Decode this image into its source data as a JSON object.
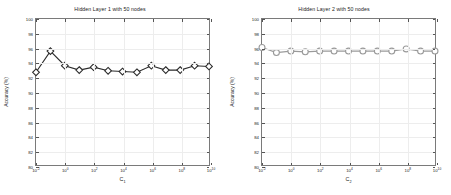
{
  "figure": {
    "background": "#ffffff",
    "width": 451,
    "height": 195
  },
  "panels": [
    {
      "id": "left",
      "title": "Hidden Layer 1 with 50 nodes",
      "xlabel_base": "C",
      "xlabel_sub": "1",
      "ylabel": "Accuracy (%)"
    },
    {
      "id": "right",
      "title": "Hidden Layer 2 with 50 nodes",
      "xlabel_base": "C",
      "xlabel_sub": "2",
      "ylabel": "Accuracy (%)"
    }
  ],
  "axis": {
    "ylim": [
      80,
      100
    ],
    "yticks": [
      80,
      82,
      84,
      86,
      88,
      90,
      92,
      94,
      96,
      98,
      100
    ],
    "ytick_labels": [
      "80",
      "82",
      "84",
      "86",
      "88",
      "90",
      "92",
      "94",
      "96",
      "98",
      "100"
    ],
    "xlim_exp": [
      -2,
      10
    ],
    "xticks_exp": [
      -2,
      0,
      2,
      4,
      6,
      8,
      10
    ],
    "xtick_mantissa": "10",
    "xtick_exponents": [
      "-2",
      "0",
      "2",
      "4",
      "6",
      "8",
      "10"
    ],
    "grid": true,
    "xscale": "log"
  },
  "chart_data": [
    {
      "type": "line",
      "title": "Hidden Layer 1 with 50 nodes",
      "xlabel": "C_1",
      "ylabel": "Accuracy (%)",
      "xscale": "log",
      "xlim": [
        0.01,
        10000000000
      ],
      "ylim": [
        80,
        100
      ],
      "grid": true,
      "legend": null,
      "marker": "diamond",
      "color": "#2b2b2b",
      "x_exponents": [
        -2,
        -1,
        0,
        1,
        2,
        3,
        4,
        5,
        6,
        7,
        8,
        9,
        10
      ],
      "x": [
        0.01,
        0.1,
        1,
        10,
        100,
        1000,
        10000,
        100000,
        1000000,
        10000000,
        100000000,
        1000000000,
        10000000000
      ],
      "values": [
        92.7,
        95.6,
        93.6,
        93.0,
        93.4,
        92.9,
        92.8,
        92.7,
        93.6,
        93.0,
        93.0,
        93.6,
        93.5
      ]
    },
    {
      "type": "line",
      "title": "Hidden Layer 2 with 50 nodes",
      "xlabel": "C_2",
      "ylabel": "Accuracy (%)",
      "xscale": "log",
      "xlim": [
        0.01,
        10000000000
      ],
      "ylim": [
        80,
        100
      ],
      "grid": true,
      "legend": null,
      "marker": "circle",
      "color": "#9a9a9a",
      "x_exponents": [
        -2,
        -1,
        0,
        1,
        2,
        3,
        4,
        5,
        6,
        7,
        8,
        9,
        10
      ],
      "x": [
        0.01,
        0.1,
        1,
        10,
        100,
        1000,
        10000,
        100000,
        1000000,
        10000000,
        100000000,
        1000000000,
        10000000000
      ],
      "values": [
        96.1,
        95.4,
        95.6,
        95.5,
        95.6,
        95.6,
        95.6,
        95.6,
        95.6,
        95.6,
        95.9,
        95.6,
        95.6
      ]
    }
  ]
}
